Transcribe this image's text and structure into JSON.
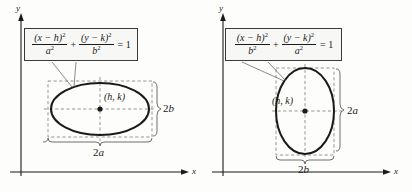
{
  "figure": {
    "background_color": "#fdfdfc",
    "stroke_color": "#1a1a1a",
    "dash_color": "#8a8a8a",
    "box_fill": "#f7f7f5",
    "box_border": "#3a3a3a"
  },
  "panels": [
    {
      "id": "horizontal-major-axis",
      "orientation": "horizontal",
      "axes": {
        "x_label": "x",
        "y_label": "y"
      },
      "formula": {
        "numerator_1": "(x − h)",
        "numerator_1_exp": "2",
        "denominator_1": "a",
        "denominator_1_exp": "2",
        "operator": "+",
        "numerator_2": "(y − k)",
        "numerator_2_exp": "2",
        "denominator_2": "b",
        "denominator_2_exp": "2",
        "equals": "= 1",
        "plain": "(x - h)^2 / a^2 + (y - k)^2 / b^2 = 1"
      },
      "center_label": "(h, k)",
      "width_label": "2a",
      "width_label_italic": "a",
      "height_label": "2b",
      "height_label_italic": "b",
      "ellipse": {
        "center_x": 100,
        "center_y": 109,
        "semi_x": 49,
        "semi_y": 26
      }
    },
    {
      "id": "vertical-major-axis",
      "orientation": "vertical",
      "axes": {
        "x_label": "x",
        "y_label": "y"
      },
      "formula": {
        "numerator_1": "(x − h)",
        "numerator_1_exp": "2",
        "denominator_1": "b",
        "denominator_1_exp": "2",
        "operator": "+",
        "numerator_2": "(y − k)",
        "numerator_2_exp": "2",
        "denominator_2": "a",
        "denominator_2_exp": "2",
        "equals": "= 1",
        "plain": "(x - h)^2 / b^2 + (y - k)^2 / a^2 = 1"
      },
      "center_label": "(h, k)",
      "width_label": "2b",
      "width_label_italic": "b",
      "height_label": "2a",
      "height_label_italic": "a",
      "ellipse": {
        "center_x": 99,
        "center_y": 111,
        "semi_x": 29,
        "semi_y": 43
      }
    }
  ]
}
